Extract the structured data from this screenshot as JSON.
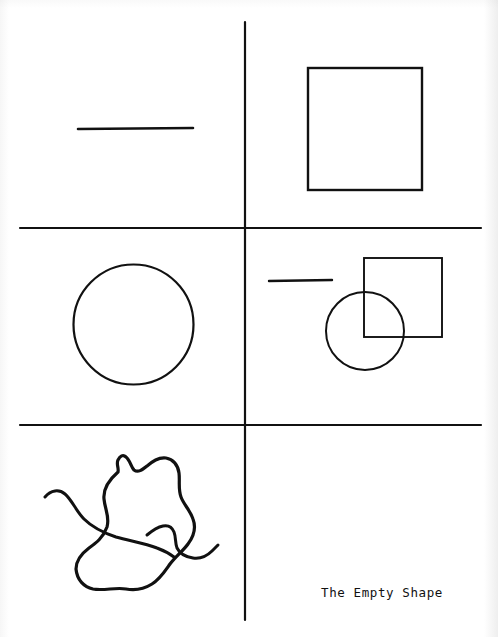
{
  "page": {
    "title": "The Empty Shape",
    "width": 498,
    "height": 637,
    "background_color": "#ffffff",
    "ink_color": "#111111",
    "medium": "scanned line drawing on white paper"
  },
  "caption": {
    "text": "The Empty Shape",
    "position": "bottom-right",
    "x": 321,
    "y": 585
  },
  "dividers": {
    "vertical": {
      "name": "vertical-divider",
      "x": 245,
      "y1": 22,
      "y2": 620,
      "stroke_width": 2.2
    },
    "horizontal": [
      {
        "name": "horizontal-divider-upper",
        "y": 228,
        "x1": 20,
        "x2": 481,
        "stroke_width": 2.2
      },
      {
        "name": "horizontal-divider-lower",
        "y": 425,
        "x1": 20,
        "x2": 481,
        "stroke_width": 2.2
      }
    ]
  },
  "quadrants": [
    {
      "name": "top-left",
      "contents": [
        "line-segment"
      ]
    },
    {
      "name": "top-right",
      "contents": [
        "square"
      ]
    },
    {
      "name": "middle-left",
      "contents": [
        "circle"
      ]
    },
    {
      "name": "middle-right",
      "contents": [
        "line-segment",
        "square",
        "circle"
      ]
    },
    {
      "name": "bottom-left",
      "contents": [
        "blob",
        "squiggle"
      ]
    },
    {
      "name": "bottom-right",
      "contents": [
        "caption"
      ]
    }
  ],
  "shapes": {
    "top_left_line": {
      "name": "line-segment",
      "x1": 78,
      "y1": 129,
      "x2": 193,
      "y2": 128,
      "stroke_width": 2.6
    },
    "top_right_square": {
      "name": "square",
      "x": 308,
      "y": 68,
      "width": 114,
      "height": 122,
      "stroke_width": 2.4
    },
    "middle_left_circle": {
      "name": "circle",
      "cx": 133.5,
      "cy": 324.5,
      "r": 60,
      "stroke_width": 2.2
    },
    "middle_right_line": {
      "name": "line-segment",
      "x1": 269,
      "y1": 281,
      "x2": 332,
      "y2": 280,
      "stroke_width": 2.4
    },
    "middle_right_square": {
      "name": "square",
      "x": 364,
      "y": 258,
      "width": 78,
      "height": 79,
      "stroke_width": 1.9
    },
    "middle_right_circle": {
      "name": "circle",
      "cx": 365,
      "cy": 331,
      "r": 39,
      "stroke_width": 2.0
    },
    "bottom_blob": {
      "name": "blob",
      "description": "closed irregular hand-drawn outline",
      "bbox": [
        70,
        455,
        125,
        135
      ],
      "stroke_width": 3.2,
      "path": "M 118 472 C 110 479 103 489 104 499 C 105 510 110 517 107 527 C 103 538 96 543 89 548 C 81 554 76 561 76 569 C 77 580 84 587 93 589 C 104 591 116 587 126 589 C 136 591 144 589 152 584 C 160 579 165 571 170 564 C 176 556 183 551 188 544 C 194 536 196 527 193 519 C 190 510 184 505 181 497 C 178 489 180 481 179 473 C 178 465 173 459 166 458 C 158 457 152 462 147 466 C 142 470 138 473 134 470 C 131 467 130 460 126 457 C 123 454 120 456 118 460 C 116 464 119 468 118 472 Z"
    },
    "bottom_squiggle": {
      "name": "squiggle",
      "description": "wavy open line crossing the blob",
      "stroke_width": 3.0,
      "path_left": "M 45 497 C 51 490 59 489 65 494 C 72 500 76 511 84 519 C 92 527 104 533 116 537 C 130 541 145 543 157 548 C 165 551 170 554 174 557",
      "path_mid": "M 147 535 C 153 530 158 527 163 526 C 168 525 172 527 174 532 C 176 537 175 543 177 548 C 180 554 186 557 193 558 C 200 559 207 556 212 551 C 215 548 217 546 218 545"
    }
  }
}
